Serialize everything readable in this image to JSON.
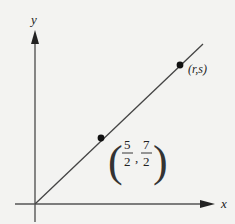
{
  "diagram": {
    "axes": {
      "x_label": "x",
      "y_label": "y"
    },
    "line": {
      "description": "line through origin",
      "color": "#444444"
    },
    "points": [
      {
        "name": "midpoint",
        "label_open": "(",
        "label_close": ")",
        "x_num": "5",
        "x_den": "2",
        "y_num": "7",
        "y_den": "2",
        "separator": ","
      },
      {
        "name": "endpoint",
        "label": "(r,s)"
      }
    ]
  }
}
